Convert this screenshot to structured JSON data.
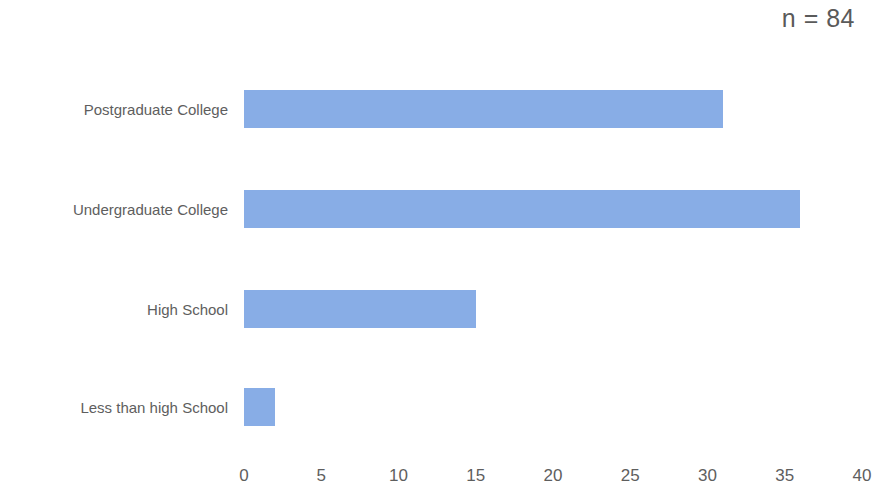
{
  "annotation": {
    "sample_size": "n = 84"
  },
  "colors": {
    "bar_fill": "#88ade6",
    "text": "#5e5e5e",
    "annotation_text": "#5a5a5a",
    "background": "#ffffff"
  },
  "chart_data": {
    "type": "bar",
    "orientation": "horizontal",
    "title": "",
    "subtitle": "",
    "xlabel": "",
    "ylabel": "",
    "categories": [
      "Postgraduate College",
      "Undergraduate College",
      "High School",
      "Less than high School"
    ],
    "values": [
      31,
      36,
      15,
      2
    ],
    "series": [
      {
        "name": "Count",
        "values": [
          31,
          36,
          15,
          2
        ]
      }
    ],
    "xlim": [
      0,
      40
    ],
    "xticks": [
      0,
      5,
      10,
      15,
      20,
      25,
      30,
      35,
      40
    ],
    "xtick_labels": [
      "0",
      "5",
      "10",
      "15",
      "20",
      "25",
      "30",
      "35",
      "40"
    ],
    "grid": false,
    "legend": false,
    "legend_position": "none",
    "annotations": [
      "n = 84"
    ]
  }
}
